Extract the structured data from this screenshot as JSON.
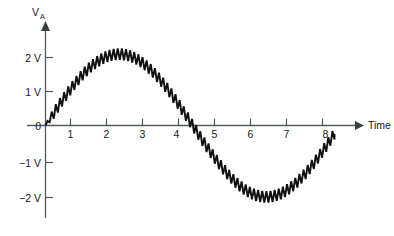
{
  "chart_data": {
    "type": "line",
    "title": "",
    "subtitle": "",
    "xlabel": "Time",
    "ylabel": "V",
    "ylabel_subscript": "A",
    "xlim": [
      0,
      8.6
    ],
    "ylim": [
      -2.55,
      2.55
    ],
    "grid": false,
    "legend": null,
    "annotations": [],
    "x_ticks": [
      {
        "value": 1,
        "label": "1"
      },
      {
        "value": 2,
        "label": "2"
      },
      {
        "value": 3,
        "label": "3"
      },
      {
        "value": 4,
        "label": "4"
      },
      {
        "value": 5,
        "label": "5"
      },
      {
        "value": 6,
        "label": "6"
      },
      {
        "value": 7,
        "label": "7"
      },
      {
        "value": 8,
        "label": "8"
      }
    ],
    "y_ticks": [
      {
        "value": 2,
        "label": "2 V"
      },
      {
        "value": 1,
        "label": "1 V"
      },
      {
        "value": 0,
        "label": "0"
      },
      {
        "value": -1,
        "label": "−1 V"
      },
      {
        "value": -2,
        "label": "−2 V"
      }
    ],
    "series": [
      {
        "name": "V_A",
        "description": "Rectified-sine carrier with superimposed sawtooth ripple",
        "color": "#111111",
        "carrier": {
          "form": "sine",
          "amplitude": 2.1,
          "period": 8.2,
          "phase": 0.0,
          "offset": 0.0,
          "x_start": 0.0,
          "x_end": 8.05
        },
        "ripple": {
          "form": "sawtooth",
          "peak_to_peak": 0.34,
          "period": 0.115,
          "count_approx": 70
        },
        "key_points": [
          {
            "x": 0.0,
            "y": 0.0
          },
          {
            "x": 1.0,
            "y": 1.26
          },
          {
            "x": 2.05,
            "y": 2.1
          },
          {
            "x": 3.0,
            "y": 1.63
          },
          {
            "x": 4.1,
            "y": 0.0
          },
          {
            "x": 5.0,
            "y": -1.33
          },
          {
            "x": 6.15,
            "y": -2.1
          },
          {
            "x": 7.0,
            "y": -1.62
          },
          {
            "x": 8.0,
            "y": -0.06
          }
        ]
      }
    ],
    "colors": {
      "axis": "#555a5d",
      "trace": "#111111",
      "text": "#17191b",
      "background": "#ffffff"
    }
  },
  "axis_labels": {
    "x_axis_name": "Time",
    "y_axis_name": "V",
    "y_axis_subscript": "A"
  }
}
